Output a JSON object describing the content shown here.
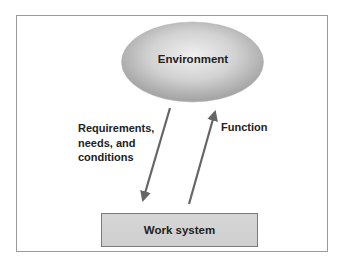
{
  "diagram": {
    "type": "flow",
    "nodes": [
      {
        "id": "environment",
        "label": "Environment",
        "shape": "ellipse"
      },
      {
        "id": "work_system",
        "label": "Work system",
        "shape": "rectangle"
      }
    ],
    "edges": [
      {
        "from": "environment",
        "to": "work_system",
        "label_lines": [
          "Requirements,",
          "needs, and",
          "conditions"
        ]
      },
      {
        "from": "work_system",
        "to": "environment",
        "label": "Function"
      }
    ]
  },
  "colors": {
    "frame_border": "#9a9a9a",
    "ellipse_center": "#ececec",
    "ellipse_edge": "#a8a8a8",
    "box_fill": "#d2d2d2",
    "box_border": "#7a7a7a",
    "arrow": "#666666",
    "text": "#222222"
  }
}
